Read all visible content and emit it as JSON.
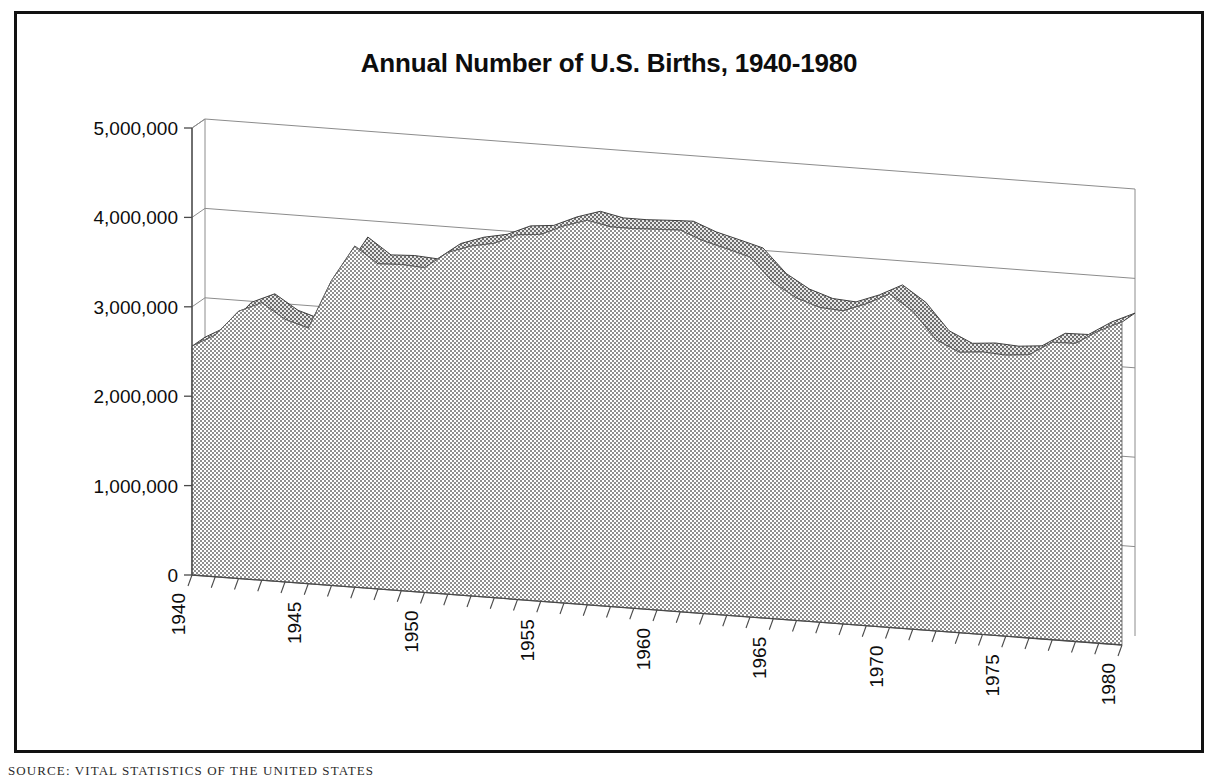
{
  "figure": {
    "title": "Annual Number of U.S. Births, 1940-1980",
    "source_note": "SOURCE: VITAL STATISTICS OF THE UNITED STATES",
    "border_color": "#111111",
    "background_color": "#ffffff"
  },
  "chart_data": {
    "type": "area",
    "title": "Annual Number of U.S. Births, 1940-1980",
    "subtitle": "",
    "xlabel": "",
    "ylabel": "",
    "style": "3d-perspective-area",
    "grid": true,
    "grid_lines_at": [
      1000000,
      2000000,
      3000000,
      4000000,
      5000000
    ],
    "legend": false,
    "legend_position": "none",
    "area_fill_color": "#9a9a9a",
    "area_fill_pattern": "50-percent-checkerboard-dither",
    "area_edge_color": "#4a4a4a",
    "axis_line_color": "#555555",
    "xlim": [
      1940,
      1980
    ],
    "ylim": [
      0,
      5000000
    ],
    "x_tick_interval": 1,
    "x_label_interval": 5,
    "y_tick_interval": 1000000,
    "ytick_labels": [
      "0",
      "1,000,000",
      "2,000,000",
      "3,000,000",
      "4,000,000",
      "5,000,000"
    ],
    "ytick_values": [
      0,
      1000000,
      2000000,
      3000000,
      4000000,
      5000000
    ],
    "xtick_labels": [
      "1940",
      "1945",
      "1950",
      "1955",
      "1960",
      "1965",
      "1970",
      "1975",
      "1980"
    ],
    "xtick_label_rotation": -90,
    "x": [
      1940,
      1941,
      1942,
      1943,
      1944,
      1945,
      1946,
      1947,
      1948,
      1949,
      1950,
      1951,
      1952,
      1953,
      1954,
      1955,
      1956,
      1957,
      1958,
      1959,
      1960,
      1961,
      1962,
      1963,
      1964,
      1965,
      1966,
      1967,
      1968,
      1969,
      1970,
      1971,
      1972,
      1973,
      1974,
      1975,
      1976,
      1977,
      1978,
      1979,
      1980
    ],
    "series": [
      {
        "name": "Annual U.S. Births",
        "values": [
          2559000,
          2703000,
          2989000,
          3104000,
          2939000,
          2858000,
          3411000,
          3817000,
          3637000,
          3649000,
          3632000,
          3823000,
          3913000,
          3965000,
          4078000,
          4104000,
          4218000,
          4300000,
          4246000,
          4245000,
          4258000,
          4268000,
          4167000,
          4098000,
          4027000,
          3760000,
          3606000,
          3521000,
          3502000,
          3600000,
          3731000,
          3556000,
          3258000,
          3137000,
          3160000,
          3144000,
          3168000,
          3327000,
          3333000,
          3494000,
          3612000
        ]
      }
    ],
    "annotations": []
  },
  "geometry": {
    "origin_front_x": 192,
    "origin_front_y": 575,
    "origin_back_x": 205,
    "origin_back_y": 128,
    "axis_height_px": 447,
    "plot_width_px": 930,
    "depth_drop_px": 70
  }
}
